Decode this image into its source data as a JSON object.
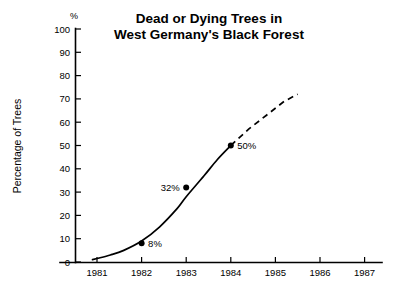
{
  "chart_data": {
    "type": "line",
    "title": "Dead or Dying Trees in West Germany's Black Forest",
    "title_lines": [
      "Dead or Dying Trees in",
      "West Germany's Black Forest"
    ],
    "xlabel": "",
    "ylabel": "Percentage of Trees",
    "y_unit_symbol": "%",
    "xlim": [
      1980.6,
      1987.1
    ],
    "ylim": [
      0,
      100
    ],
    "grid": false,
    "legend": "none",
    "y_ticks": [
      0,
      10,
      20,
      30,
      40,
      50,
      60,
      70,
      80,
      90,
      100
    ],
    "y_tick_labels": [
      "0",
      "10",
      "20",
      "30",
      "40",
      "50",
      "60",
      "70",
      "80",
      "90",
      "100"
    ],
    "x_ticks": [
      1981,
      1982,
      1983,
      1984,
      1985,
      1986,
      1987
    ],
    "x_tick_labels": [
      "1981",
      "1982",
      "1983",
      "1984",
      "1985",
      "1986",
      "1987"
    ],
    "series": [
      {
        "name": "Observed",
        "style": "solid",
        "x": [
          1980.9,
          1981.0,
          1981.3,
          1981.6,
          1982.0,
          1982.4,
          1982.8,
          1983.0,
          1983.4,
          1983.7,
          1984.0
        ],
        "values": [
          1,
          1.5,
          3,
          5,
          9,
          15,
          23,
          28,
          37,
          44,
          50
        ]
      },
      {
        "name": "Projected",
        "style": "dashed",
        "x": [
          1984.0,
          1984.4,
          1984.8,
          1985.2,
          1985.5
        ],
        "values": [
          50,
          57,
          63,
          69,
          72
        ]
      }
    ],
    "annotations": [
      {
        "label": "8%",
        "x": 1982,
        "y": 8,
        "label_side": "right"
      },
      {
        "label": "32%",
        "x": 1983,
        "y": 32,
        "label_side": "left"
      },
      {
        "label": "50%",
        "x": 1984,
        "y": 50,
        "label_side": "right"
      }
    ]
  }
}
